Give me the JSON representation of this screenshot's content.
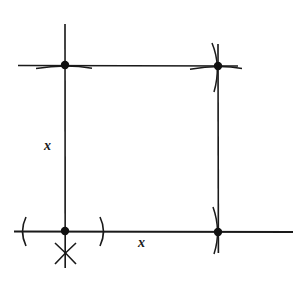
{
  "figure": {
    "type": "geometric-construction",
    "background_color": "#ffffff",
    "stroke_color": "#1a1a1a",
    "canvas": {
      "width": 300,
      "height": 295
    },
    "labels": {
      "left_side": "x",
      "bottom_side": "x"
    },
    "square": {
      "vertices": {
        "top_left": {
          "x": 65,
          "y": 65
        },
        "top_right": {
          "x": 218,
          "y": 66
        },
        "bottom_left": {
          "x": 65,
          "y": 231
        },
        "bottom_right": {
          "x": 218,
          "y": 232
        }
      },
      "side_length_label": "x",
      "vertex_dot_radius": 4
    },
    "construction_marks": {
      "left_arc_label": "(",
      "right_arc_label": ")",
      "intersection_mark": "X",
      "arc_count": 6,
      "description": "Compass arcs crossing the baseline and an X intersection mark below the bottom-left vertex"
    },
    "guide_lines": {
      "horizontal_baseline_extends_left_to": 14,
      "horizontal_baseline_extends_right_to": 293,
      "horizontal_top_extends_left_to": 18,
      "horizontal_top_extends_right_to": 238,
      "vertical_left_extends_up_to": 24,
      "vertical_left_extends_down_to": 268,
      "vertical_right_extends_up_to": 44,
      "vertical_right_extends_down_to": 253
    }
  }
}
